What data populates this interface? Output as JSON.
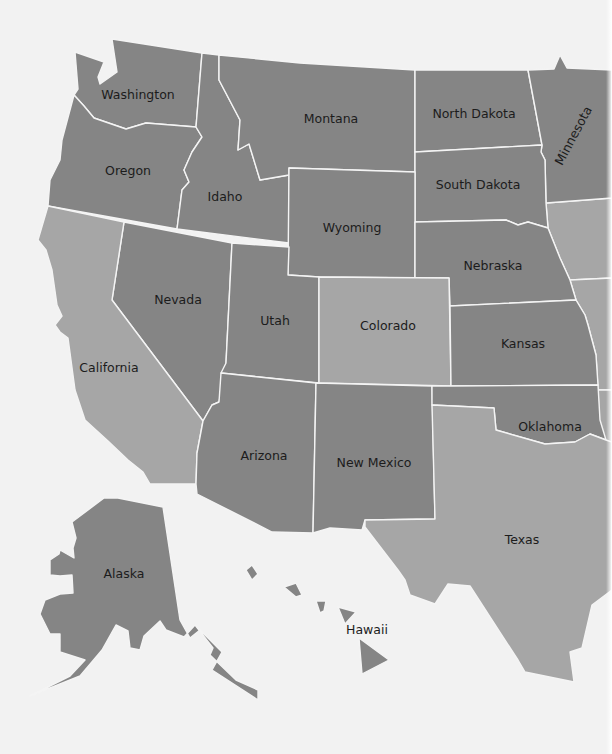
{
  "map": {
    "title": "",
    "colors": {
      "background": "#f2f2f2",
      "dark_state": "#858585",
      "light_state": "#a6a6a6",
      "border": "#f4f4f4",
      "label": "#1c1c1c"
    },
    "legend": {
      "dark": "States shaded dark gray",
      "light": "States shaded light gray"
    },
    "states": {
      "washington": "Washington",
      "oregon": "Oregon",
      "idaho": "Idaho",
      "montana": "Montana",
      "north_dakota": "North Dakota",
      "minnesota": "Minnesota",
      "south_dakota": "South Dakota",
      "wyoming": "Wyoming",
      "nebraska": "Nebraska",
      "nevada": "Nevada",
      "utah": "Utah",
      "colorado": "Colorado",
      "kansas": "Kansas",
      "california": "California",
      "arizona": "Arizona",
      "new_mexico": "New Mexico",
      "oklahoma": "Oklahoma",
      "texas": "Texas",
      "alaska": "Alaska",
      "hawaii": "Hawaii"
    },
    "shading": {
      "dark": [
        "Washington",
        "Oregon",
        "Idaho",
        "Montana",
        "North Dakota",
        "Minnesota",
        "South Dakota",
        "Wyoming",
        "Nebraska",
        "Nevada",
        "Utah",
        "Kansas",
        "Arizona",
        "New Mexico",
        "Oklahoma",
        "Alaska",
        "Hawaii"
      ],
      "light": [
        "California",
        "Colorado",
        "Texas",
        "Iowa (partial)",
        "Missouri (partial)",
        "Arkansas (partial)"
      ]
    }
  }
}
